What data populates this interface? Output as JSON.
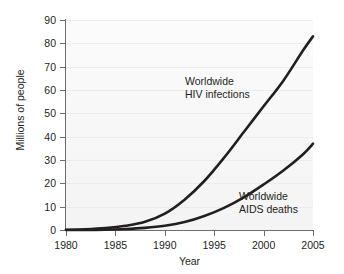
{
  "chart_data": {
    "type": "line",
    "title": "",
    "xlabel": "Year",
    "ylabel": "Millions of people",
    "xlim": [
      1980,
      2005
    ],
    "ylim": [
      0,
      90
    ],
    "x_ticks": [
      1980,
      1985,
      1990,
      1995,
      2000,
      2005
    ],
    "y_ticks": [
      0,
      10,
      20,
      30,
      40,
      50,
      60,
      70,
      80,
      90
    ],
    "grid": true,
    "grid_axis": "y",
    "legend": "inline-annotations",
    "series": [
      {
        "name": "Worldwide HIV infections",
        "color": "#231f20",
        "annotation_lines": [
          "Worldwide",
          "HIV infections"
        ],
        "x": [
          1980,
          1982,
          1984,
          1986,
          1988,
          1990,
          1992,
          1994,
          1996,
          1998,
          2000,
          2002,
          2004,
          2005
        ],
        "values": [
          0.1,
          0.3,
          0.8,
          1.8,
          3.5,
          7,
          13,
          21,
          31,
          42,
          53,
          64,
          77,
          83
        ]
      },
      {
        "name": "Worldwide AIDS deaths",
        "color": "#231f20",
        "annotation_lines": [
          "Worldwide",
          "AIDS deaths"
        ],
        "x": [
          1980,
          1982,
          1984,
          1986,
          1988,
          1990,
          1992,
          1994,
          1996,
          1998,
          2000,
          2002,
          2004,
          2005
        ],
        "values": [
          0.0,
          0.05,
          0.15,
          0.4,
          0.9,
          1.8,
          3.4,
          6.0,
          9.5,
          14.0,
          19.5,
          25.5,
          32.5,
          37
        ]
      }
    ]
  },
  "axes": {
    "y_title": "Millions of people",
    "x_title": "Year",
    "y_tick_labels": [
      "90",
      "80",
      "70",
      "60",
      "50",
      "40",
      "30",
      "20",
      "10",
      "0"
    ],
    "x_tick_labels": [
      "1980",
      "1985",
      "1990",
      "1995",
      "2000",
      "2005"
    ]
  },
  "annotations": {
    "hiv": {
      "line1": "Worldwide",
      "line2": "HIV infections"
    },
    "aids": {
      "line1": "Worldwide",
      "line2": "AIDS deaths"
    }
  },
  "colors": {
    "curve": "#231f20",
    "axis": "#6d6e70",
    "gridline": "#ececec",
    "plot_background": "#f8f8f8",
    "page_background": "#ffffff"
  }
}
